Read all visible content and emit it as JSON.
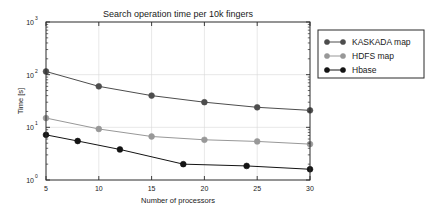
{
  "chart_data": {
    "type": "line",
    "title": "Search operation time per 10k fingers",
    "xlabel": "Number of processors",
    "ylabel": "Time [s]",
    "xlim": [
      5,
      30
    ],
    "ylim": [
      1,
      1000
    ],
    "yscale": "log",
    "xscale": "linear",
    "grid": true,
    "legend_position": "outside-right-top",
    "xticks": [
      5,
      10,
      15,
      20,
      25,
      30
    ],
    "xtick_labels": [
      "5",
      "10",
      "15",
      "20",
      "25",
      "30"
    ],
    "ytick_labels": [
      "10^0",
      "10^1",
      "10^2",
      "10^3"
    ],
    "ytick_values": [
      1,
      10,
      100,
      1000
    ],
    "series": [
      {
        "name": "KASKADA map",
        "color": "#4d4d4d",
        "marker": "circle",
        "x": [
          5,
          10,
          15,
          20,
          25,
          30
        ],
        "values": [
          115,
          60,
          40,
          30,
          24,
          21
        ]
      },
      {
        "name": "HDFS map",
        "color": "#989898",
        "marker": "circle",
        "x": [
          5,
          10,
          15,
          20,
          25,
          30
        ],
        "values": [
          15,
          9.3,
          6.7,
          5.8,
          5.4,
          4.8
        ]
      },
      {
        "name": "Hbase",
        "color": "#141414",
        "marker": "circle",
        "x": [
          5,
          8,
          12,
          18,
          24,
          30
        ],
        "values": [
          7.2,
          5.5,
          3.8,
          2.0,
          1.85,
          1.6
        ]
      }
    ]
  },
  "legend": {
    "entries": [
      {
        "label": "KASKADA map"
      },
      {
        "label": "HDFS map"
      },
      {
        "label": "Hbase"
      }
    ]
  }
}
